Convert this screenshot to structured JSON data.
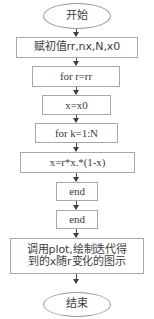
{
  "diagram": {
    "accent_color": "#a8a8a8",
    "text_color": "#3c3c3c",
    "arrow_color": "#3f3f3f",
    "nodes": [
      {
        "id": "start",
        "shape": "terminal",
        "label": "开始"
      },
      {
        "id": "init",
        "shape": "process",
        "label": "赋初值rr,nx,N,x0"
      },
      {
        "id": "for_r",
        "shape": "process",
        "label": "for  r=rr"
      },
      {
        "id": "set_x",
        "shape": "process",
        "label": "x=x0"
      },
      {
        "id": "for_k",
        "shape": "process",
        "label": "for  k=1:N"
      },
      {
        "id": "iterate",
        "shape": "process",
        "label": "x=r*x.*(1-x)"
      },
      {
        "id": "end_inner",
        "shape": "process",
        "label": "end"
      },
      {
        "id": "end_outer",
        "shape": "process",
        "label": "end"
      },
      {
        "id": "plot",
        "shape": "process",
        "label": "调用plot,绘制迭代得\n到的x随r变化的图示"
      },
      {
        "id": "stop",
        "shape": "terminal",
        "label": "结束"
      }
    ]
  }
}
